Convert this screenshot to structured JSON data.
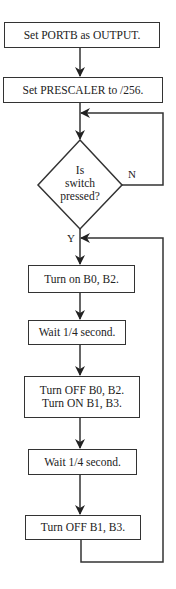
{
  "flowchart": {
    "steps": [
      {
        "text": "Set PORTB as OUTPUT."
      },
      {
        "text": "Set PRESCALER to /256."
      },
      {
        "lines": [
          "Is",
          "switch",
          "pressed?"
        ]
      },
      {
        "text": "Turn on B0, B2."
      },
      {
        "text": "Wait 1/4 second."
      },
      {
        "lines": [
          "Turn OFF B0, B2.",
          "Turn ON B1, B3."
        ]
      },
      {
        "text": "Wait 1/4 second."
      },
      {
        "text": "Turn OFF B1, B3."
      }
    ],
    "labels": {
      "no": "N",
      "yes": "Y"
    }
  }
}
